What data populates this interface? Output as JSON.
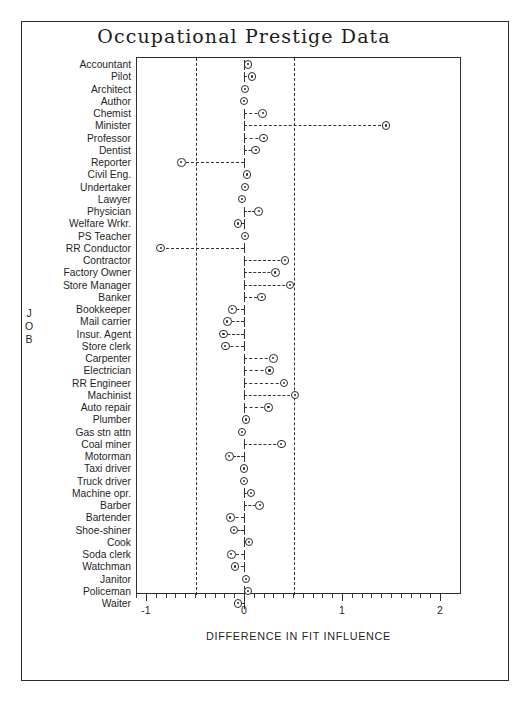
{
  "figure": {
    "title": "Occupational Prestige Data",
    "xaxis_title": "DIFFERENCE IN FIT INFLUENCE",
    "yaxis_title_chars": [
      "J",
      "O",
      "B"
    ],
    "border_color": "#2b2b2b",
    "marker_color": "#2b2b2b",
    "reference_line_color": "#323232"
  },
  "chart_data": {
    "type": "scatter",
    "title": "Occupational Prestige Data",
    "xlabel": "DIFFERENCE IN FIT INFLUENCE",
    "ylabel": "JOB",
    "xlim": [
      -1.15,
      2.0
    ],
    "ylim_categories": 44,
    "grid": false,
    "legend": null,
    "annotations": [
      {
        "type": "vertical-reference-line",
        "x": -0.5,
        "style": "dashed"
      },
      {
        "type": "vertical-reference-line",
        "x": 0.5,
        "style": "dashed"
      },
      {
        "type": "leader-line",
        "from_x": 0,
        "style": "dashed",
        "note": "each point connected to x=0 baseline by a dashed whisker with a tick cap at 0"
      }
    ],
    "xticks_major": [
      -1,
      0,
      1,
      2
    ],
    "xticklabels": [
      "-1",
      "0",
      "1",
      "2"
    ],
    "xticks_minor_step": 0.1,
    "categories": [
      "Accountant",
      "Pilot",
      "Architect",
      "Author",
      "Chemist",
      "Minister",
      "Professor",
      "Dentist",
      "Reporter",
      "Civil Eng.",
      "Undertaker",
      "Lawyer",
      "Physician",
      "Welfare Wrkr.",
      "PS Teacher",
      "RR Conductor",
      "Contractor",
      "Factory Owner",
      "Store Manager",
      "Banker",
      "Bookkeeper",
      "Mail carrier",
      "Insur. Agent",
      "Store clerk",
      "Carpenter",
      "Electrician",
      "RR Engineer",
      "Machinist",
      "Auto repair",
      "Plumber",
      "Gas stn attn",
      "Coal miner",
      "Motorman",
      "Taxi driver",
      "Truck driver",
      "Machine opr.",
      "Barber",
      "Bartender",
      "Shoe-shiner",
      "Cook",
      "Soda clerk",
      "Watchman",
      "Janitor",
      "Policeman",
      "Waiter"
    ],
    "values": [
      0.04,
      0.08,
      0.01,
      0.0,
      0.19,
      1.45,
      0.2,
      0.12,
      -0.64,
      0.03,
      0.01,
      -0.02,
      0.15,
      -0.06,
      0.01,
      -0.85,
      0.42,
      0.32,
      0.47,
      0.18,
      -0.12,
      -0.17,
      -0.21,
      -0.19,
      0.3,
      0.26,
      0.41,
      0.52,
      0.25,
      0.02,
      -0.02,
      0.38,
      -0.15,
      0.0,
      0.0,
      0.07,
      0.16,
      -0.14,
      -0.1,
      0.05,
      -0.13,
      -0.09,
      0.02,
      0.04,
      -0.06
    ]
  }
}
